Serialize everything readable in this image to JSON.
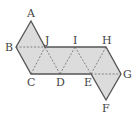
{
  "figure": {
    "type": "net-of-octahedron",
    "fill_color": "#dcdcdc",
    "outline_color": "#555555",
    "fold_line_color": "#777777",
    "background": "#ffffff"
  },
  "vertices": {
    "A": {
      "label": "A",
      "x": 31,
      "y": 21
    },
    "B": {
      "label": "B",
      "x": 16,
      "y": 47
    },
    "J": {
      "label": "J",
      "x": 45,
      "y": 47
    },
    "I": {
      "label": "I",
      "x": 75,
      "y": 47
    },
    "H": {
      "label": "H",
      "x": 106,
      "y": 47
    },
    "C": {
      "label": "C",
      "x": 31,
      "y": 74
    },
    "D": {
      "label": "D",
      "x": 60,
      "y": 74
    },
    "E": {
      "label": "E",
      "x": 91,
      "y": 74
    },
    "G": {
      "label": "G",
      "x": 121,
      "y": 74
    },
    "F": {
      "label": "F",
      "x": 106,
      "y": 100
    }
  },
  "outline_path": [
    "A",
    "J",
    "H",
    "G",
    "F",
    "E",
    "C",
    "B"
  ],
  "fold_lines": [
    [
      "B",
      "J"
    ],
    [
      "C",
      "J"
    ],
    [
      "J",
      "D"
    ],
    [
      "D",
      "I"
    ],
    [
      "I",
      "E"
    ],
    [
      "E",
      "H"
    ],
    [
      "E",
      "G"
    ]
  ],
  "labels": {
    "A": "A",
    "B": "B",
    "C": "C",
    "D": "D",
    "E": "E",
    "F": "F",
    "G": "G",
    "H": "H",
    "I": "I",
    "J": "J"
  }
}
